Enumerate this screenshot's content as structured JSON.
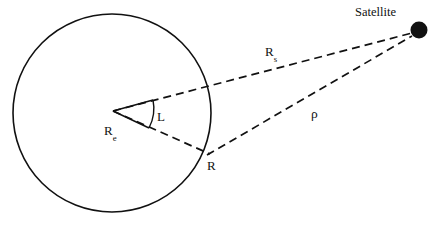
{
  "figure": {
    "type": "geometry-diagram",
    "background_color": "#ffffff",
    "stroke_color": "#111111"
  },
  "labels": {
    "satellite": "Satellite",
    "slant_range": "ρ",
    "satellite_radius_base": "R",
    "satellite_radius_sub": "s",
    "earth_radius_base": "R",
    "earth_radius_sub": "e",
    "central_angle": "L",
    "surface_point": "R"
  },
  "geometry": {
    "circle": {
      "name": "earth-circle",
      "center_x": 112,
      "center_y": 113,
      "radius": 99,
      "stroke_width": 1.6,
      "fill": "none"
    },
    "satellite_dot": {
      "name": "satellite-dot",
      "center_x": 419,
      "center_y": 30,
      "radius": 8.5,
      "fill": "#111111"
    },
    "line_rs": {
      "name": "line-earth-center-to-satellite",
      "x1": 113,
      "y1": 111,
      "x2": 412,
      "y2": 33,
      "dash": "8,5",
      "stroke_width": 1.7
    },
    "line_r_surface": {
      "name": "line-earth-center-to-surface-point",
      "x1": 113,
      "y1": 111,
      "x2": 210,
      "y2": 154,
      "dash": "8,5",
      "stroke_width": 1.7
    },
    "line_rho": {
      "name": "line-surface-point-to-satellite",
      "x1": 207,
      "y1": 155,
      "x2": 412,
      "y2": 36,
      "dash": "8,5",
      "stroke_width": 1.7
    },
    "angle_ray_upper": {
      "name": "angle-ray-upper",
      "x1": 113,
      "y1": 111,
      "x2": 153,
      "y2": 100,
      "stroke_width": 1.4
    },
    "angle_ray_lower": {
      "name": "angle-ray-lower",
      "x1": 113,
      "y1": 111,
      "x2": 149,
      "y2": 128,
      "stroke_width": 1.4
    },
    "angle_arc": {
      "name": "angle-arc",
      "path": "M 153 100 A 42 42 0 0 1 149 128",
      "stroke_width": 1.4
    }
  },
  "label_positions": {
    "satellite": {
      "x": 355,
      "y": 6
    },
    "rs": {
      "x": 265,
      "y": 45
    },
    "rho": {
      "x": 311,
      "y": 107
    },
    "re": {
      "x": 104,
      "y": 124
    },
    "L": {
      "x": 157,
      "y": 110
    },
    "R": {
      "x": 207,
      "y": 159
    }
  }
}
